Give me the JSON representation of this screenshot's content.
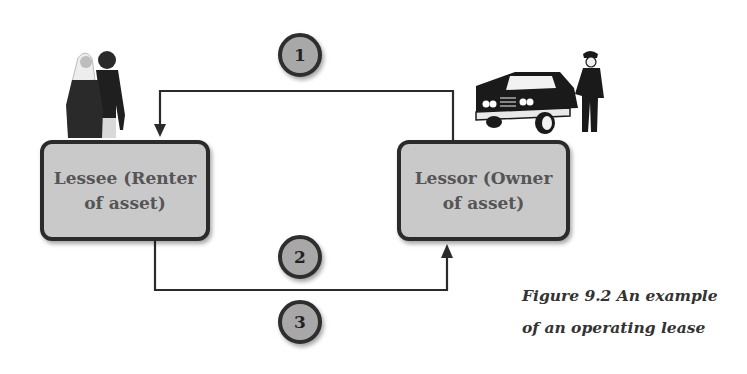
{
  "diagram": {
    "type": "flow",
    "nodes": [
      {
        "id": "lessee",
        "label_line1": "Lessee (Renter",
        "label_line2": "of asset)",
        "illustration": "couple-people-icon"
      },
      {
        "id": "lessor",
        "label_line1": "Lessor (Owner",
        "label_line2": "of asset)",
        "illustration": "car-with-chauffeur-icon"
      }
    ],
    "steps": [
      {
        "number": "1",
        "from": "lessor",
        "to": "lessee",
        "path": "top"
      },
      {
        "number": "2",
        "from": "lessee",
        "to": "lessor",
        "path": "bottom"
      },
      {
        "number": "3",
        "from": "lessee",
        "to": "lessor",
        "path": "bottom"
      }
    ],
    "colors": {
      "box_fill": "#c9c9c9",
      "box_border": "#2b2b2b",
      "circle_fill": "#a8a8a8",
      "line": "#2b2b2b"
    }
  },
  "caption": {
    "line1": "Figure 9.2 An example",
    "line2": "of an operating lease"
  }
}
